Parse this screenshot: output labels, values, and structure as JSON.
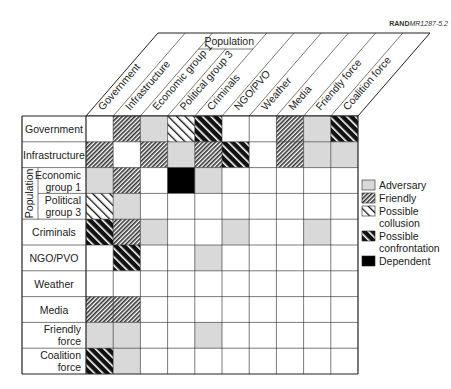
{
  "figure_code": {
    "bold": "RAND",
    "italic": "MR1287-5.2"
  },
  "header_group_label": "Population",
  "row_group_label": "Population",
  "columns": [
    "Government",
    "Infrastructure",
    "Economic group 1",
    "Political group 3",
    "Criminals",
    "NGO/PVO",
    "Weather",
    "Media",
    "Friendly force",
    "Coalition force"
  ],
  "rows": [
    {
      "label": [
        "Government"
      ],
      "cells": [
        "",
        "friendly",
        "adversary",
        "collusion",
        "confrontation",
        "",
        "",
        "friendly",
        "adversary",
        "confrontation"
      ]
    },
    {
      "label": [
        "Infrastructure"
      ],
      "cells": [
        "friendly",
        "",
        "friendly",
        "adversary",
        "friendly",
        "confrontation",
        "",
        "friendly",
        "adversary",
        "adversary"
      ]
    },
    {
      "label": [
        "Economic",
        "group 1"
      ],
      "group": "Population",
      "cells": [
        "adversary",
        "friendly",
        "",
        "dependent",
        "adversary",
        "",
        "",
        "",
        "",
        ""
      ]
    },
    {
      "label": [
        "Political",
        "group 3"
      ],
      "group": "Population",
      "cells": [
        "collusion",
        "adversary",
        "",
        "",
        "",
        "",
        "",
        "",
        "",
        ""
      ]
    },
    {
      "label": [
        "Criminals"
      ],
      "cells": [
        "confrontation",
        "friendly",
        "adversary",
        "",
        "",
        "adversary",
        "",
        "",
        "adversary",
        ""
      ]
    },
    {
      "label": [
        "NGO/PVO"
      ],
      "cells": [
        "",
        "confrontation",
        "",
        "",
        "adversary",
        "",
        "",
        "",
        "",
        ""
      ]
    },
    {
      "label": [
        "Weather"
      ],
      "cells": [
        "",
        "",
        "",
        "",
        "",
        "",
        "",
        "",
        "",
        ""
      ]
    },
    {
      "label": [
        "Media"
      ],
      "cells": [
        "friendly",
        "friendly",
        "",
        "",
        "",
        "",
        "",
        "",
        "",
        ""
      ]
    },
    {
      "label": [
        "Friendly",
        "force"
      ],
      "cells": [
        "adversary",
        "adversary",
        "",
        "",
        "adversary",
        "",
        "",
        "",
        "",
        ""
      ]
    },
    {
      "label": [
        "Coalition",
        "force"
      ],
      "cells": [
        "confrontation",
        "adversary",
        "",
        "",
        "",
        "",
        "",
        "",
        "",
        ""
      ]
    }
  ],
  "legend": [
    {
      "key": "adversary",
      "label": [
        "Adversary"
      ]
    },
    {
      "key": "friendly",
      "label": [
        "Friendly"
      ]
    },
    {
      "key": "collusion",
      "label": [
        "Possible",
        "collusion"
      ]
    },
    {
      "key": "confrontation",
      "label": [
        "Possible",
        "confrontation"
      ]
    },
    {
      "key": "dependent",
      "label": [
        "Dependent"
      ]
    }
  ],
  "colors": {
    "adversary": "#d9d9d9",
    "dependent": "#000000",
    "line": "#222222"
  }
}
